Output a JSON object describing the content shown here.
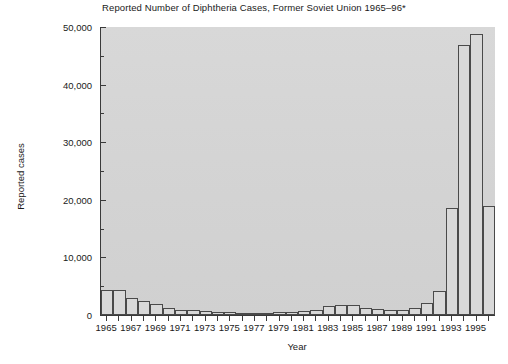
{
  "chart_data": {
    "type": "bar",
    "title": "Reported Number of Diphtheria Cases, Former Soviet Union 1965–96*",
    "xlabel": "Year",
    "ylabel": "Reported cases",
    "ylim": [
      0,
      50000
    ],
    "xlim": [
      1964.5,
      1996.5
    ],
    "grid": false,
    "legend": null,
    "y_major_ticks": [
      0,
      10000,
      20000,
      30000,
      40000,
      50000
    ],
    "y_major_tick_labels": [
      "0",
      "10,000",
      "20,000",
      "30,000",
      "40,000",
      "50,000"
    ],
    "y_minor_ticks": [
      5000,
      15000,
      25000,
      35000,
      45000
    ],
    "x_tick_labels": [
      "1965",
      "1967",
      "1969",
      "1971",
      "1973",
      "1975",
      "1977",
      "1979",
      "1981",
      "1983",
      "1985",
      "1987",
      "1989",
      "1991",
      "1993",
      "1995"
    ],
    "categories": [
      1965,
      1966,
      1967,
      1968,
      1969,
      1970,
      1971,
      1972,
      1973,
      1974,
      1975,
      1976,
      1977,
      1978,
      1979,
      1980,
      1981,
      1982,
      1983,
      1984,
      1985,
      1986,
      1987,
      1988,
      1989,
      1990,
      1991,
      1992,
      1993,
      1994,
      1995,
      1996
    ],
    "values": [
      4400,
      4400,
      3000,
      2400,
      1900,
      1200,
      900,
      800,
      700,
      600,
      500,
      400,
      400,
      400,
      500,
      600,
      700,
      900,
      1500,
      1700,
      1700,
      1200,
      1100,
      900,
      800,
      1200,
      2000,
      4200,
      18500,
      46800,
      48800,
      19000
    ],
    "plot_background": "#d4d4d4",
    "bar_fill": "#d9d9d9",
    "bar_edge": "#4a4a4a",
    "axis_color": "#3a3a3a"
  }
}
